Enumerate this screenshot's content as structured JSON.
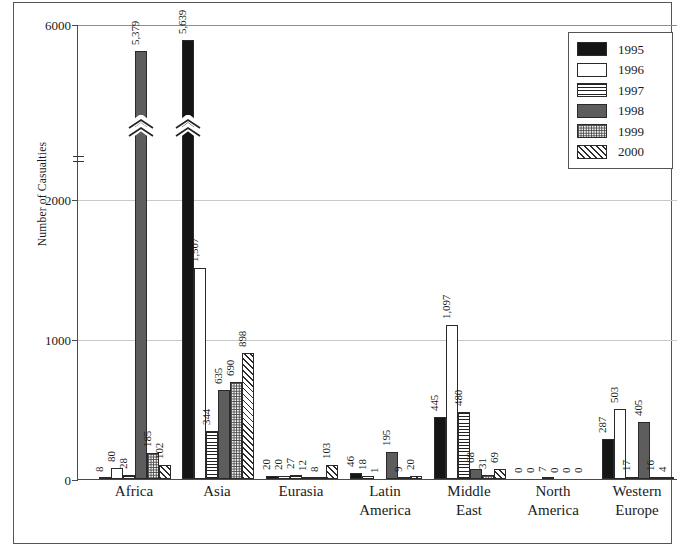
{
  "chart_data": {
    "type": "bar",
    "title": "",
    "xlabel": "",
    "ylabel": "Number of Casualties",
    "categories": [
      "Africa",
      "Asia",
      "Eurasia",
      "Latin\nAmerica",
      "Middle\nEast",
      "North\nAmerica",
      "Western\nEurope"
    ],
    "ylim": [
      0,
      6000
    ],
    "yticks": [
      0,
      1000,
      2000,
      6000
    ],
    "ytick_labels": [
      "0",
      "1000",
      "2000",
      "6000"
    ],
    "axis_break": {
      "between": [
        2000,
        6000
      ],
      "note": "y-axis broken above 2000"
    },
    "grid": true,
    "legend_position": "top-right",
    "series": [
      {
        "name": "1995",
        "pattern": "solid-black",
        "values": [
          8,
          5639,
          20,
          46,
          445,
          0,
          287
        ],
        "labels": [
          "8",
          "5,639",
          "20",
          "46",
          "445",
          "0",
          "287"
        ]
      },
      {
        "name": "1996",
        "pattern": "solid-white",
        "values": [
          80,
          1507,
          20,
          18,
          1097,
          0,
          503
        ],
        "labels": [
          "80",
          "1,507",
          "20",
          "18",
          "1,097",
          "0",
          "503"
        ]
      },
      {
        "name": "1997",
        "pattern": "horizontal-lines",
        "values": [
          28,
          344,
          27,
          1,
          480,
          7,
          17
        ],
        "labels": [
          "28",
          "344",
          "27",
          "1",
          "480",
          "7",
          "17"
        ]
      },
      {
        "name": "1998",
        "pattern": "solid-gray",
        "values": [
          5379,
          635,
          12,
          195,
          68,
          0,
          405
        ],
        "labels": [
          "5,379",
          "635",
          "12",
          "195",
          "68",
          "0",
          "405"
        ]
      },
      {
        "name": "1999",
        "pattern": "stipple-dots",
        "values": [
          185,
          690,
          8,
          9,
          31,
          0,
          16
        ],
        "labels": [
          "185",
          "690",
          "8",
          "9",
          "31",
          "0",
          "16"
        ]
      },
      {
        "name": "2000",
        "pattern": "diagonal-hatch",
        "values": [
          102,
          898,
          103,
          20,
          69,
          0,
          4
        ],
        "labels": [
          "102",
          "898",
          "103",
          "20",
          "69",
          "0",
          "4"
        ]
      }
    ],
    "clipped_bars": [
      {
        "category": "Africa",
        "series": "1998",
        "value": 5379
      },
      {
        "category": "Asia",
        "series": "1995",
        "value": 5639
      }
    ],
    "colors": {
      "y1995": "#151515",
      "y1996": "#ffffff",
      "y1997": "#ffffff",
      "y1998": "#5d5d5d",
      "y1999": "#f2f2f2",
      "y2000": "#ffffff",
      "outline": "#2a2a2a",
      "gridline": "#c9c9c9",
      "axis": "#4a4a4a",
      "frame": "#555555",
      "background": "#ffffff"
    }
  },
  "legend": {
    "entries": [
      {
        "label": "1995",
        "swatch": "legend-swatch-1995"
      },
      {
        "label": "1996",
        "swatch": "legend-swatch-1996"
      },
      {
        "label": "1997",
        "swatch": "legend-swatch-1997"
      },
      {
        "label": "1998",
        "swatch": "legend-swatch-1998"
      },
      {
        "label": "1999",
        "swatch": "legend-swatch-1999"
      },
      {
        "label": "2000",
        "swatch": "legend-swatch-2000"
      }
    ]
  }
}
